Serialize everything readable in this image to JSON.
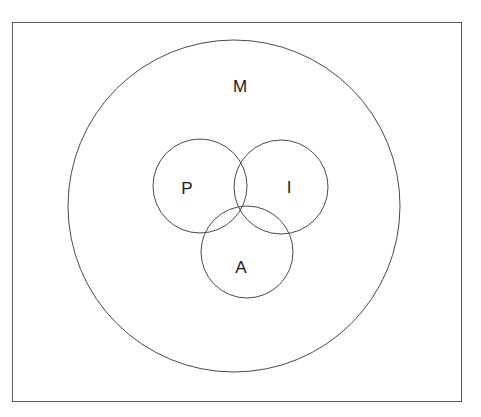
{
  "page": {
    "width": 481,
    "height": 417,
    "background_color": "#ffffff",
    "watermark_text": "",
    "frame": {
      "border_color": "#5a5a5a"
    }
  },
  "diagram": {
    "type": "venn",
    "stroke_color": "#4a4a4a",
    "fill": "none",
    "universe": {
      "label": "M",
      "name": "universe-circle",
      "cx": 234,
      "cy": 206,
      "r": 166,
      "label_x": 240,
      "label_y": 86
    },
    "sets": [
      {
        "label": "P",
        "name": "set-circle-p",
        "cx": 200,
        "cy": 186,
        "r": 47,
        "label_x": 187,
        "label_y": 188
      },
      {
        "label": "I",
        "name": "set-circle-i",
        "cx": 281,
        "cy": 187,
        "r": 47,
        "label_x": 289,
        "label_y": 187
      },
      {
        "label": "A",
        "name": "set-circle-a",
        "cx": 247,
        "cy": 252,
        "r": 46,
        "label_x": 241,
        "label_y": 267
      }
    ]
  }
}
